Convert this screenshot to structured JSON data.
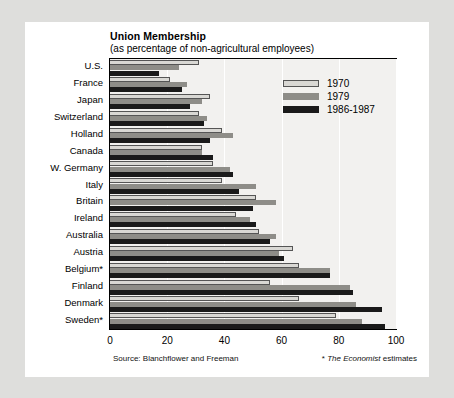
{
  "chart_data": {
    "type": "bar",
    "orientation": "horizontal",
    "title": "Union Membership",
    "subtitle": "(as percentage of non-agricultural employees)",
    "xlabel": "",
    "ylabel": "",
    "xlim": [
      0,
      100
    ],
    "xticks": [
      "0",
      "20",
      "40",
      "60",
      "80",
      "100"
    ],
    "grid": true,
    "legend_position": "top-right",
    "categories": [
      "U.S.",
      "France",
      "Japan",
      "Switzerland",
      "Holland",
      "Canada",
      "W. Germany",
      "Italy",
      "Britain",
      "Ireland",
      "Australia",
      "Austria",
      "Belgium*",
      "Finland",
      "Denmark",
      "Sweden*"
    ],
    "series": [
      {
        "name": "1970",
        "color": "#d9d8d4",
        "values": [
          31,
          21,
          35,
          31,
          39,
          32,
          36,
          39,
          51,
          44,
          52,
          64,
          66,
          56,
          66,
          79
        ]
      },
      {
        "name": "1979",
        "color": "#8e8d88",
        "values": [
          24,
          27,
          32,
          34,
          43,
          32,
          42,
          51,
          58,
          49,
          58,
          59,
          77,
          84,
          86,
          88
        ]
      },
      {
        "name": "1986-1987",
        "color": "#1a1a1a",
        "values": [
          17,
          25,
          28,
          33,
          35,
          36,
          43,
          45,
          50,
          51,
          56,
          61,
          77,
          85,
          95,
          96
        ]
      }
    ],
    "source": "Source: Blanchflower and Freeman",
    "footnote_marker": "*",
    "footnote_italic": "The Economist",
    "footnote_rest": "estimates"
  },
  "colors": {
    "page_background": "#dededc",
    "figure_background": "#ffffff",
    "plot_background": "#f2f1ef",
    "axis": "#000000",
    "gridline": "#ffffff"
  }
}
